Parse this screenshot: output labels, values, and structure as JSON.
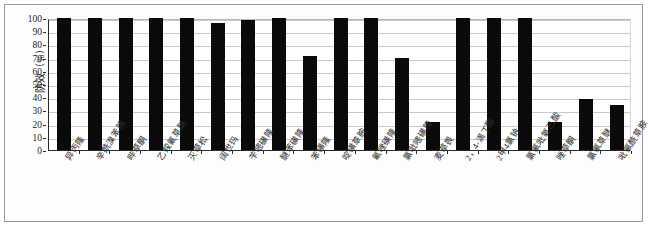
{
  "chart_data": {
    "type": "bar",
    "title": "",
    "subtitle": "",
    "xlabel": "",
    "ylabel": "防效（%）",
    "ylim": [
      0,
      100
    ],
    "yticks": [
      0,
      10,
      20,
      30,
      40,
      50,
      60,
      70,
      80,
      90,
      100
    ],
    "grid": true,
    "legend": null,
    "bar_color": "#0a0a0a",
    "categories": [
      "异丙隆",
      "辛酰溴苯腈",
      "哔草酮",
      "乙羧氟草醚",
      "灭草松",
      "阔世玛",
      "苄嘧磺隆",
      "醚苯磺隆",
      "苯磺隆",
      "啶磺草胺",
      "氟唑磺隆",
      "氯吡嘧磺隆",
      "麦草畏",
      "2，4-滴丁酯",
      "2甲4氯钠",
      "氯氟吡氧乙酸",
      "唑草酮",
      "氯氟草醚",
      "吡氟酰草胺"
    ],
    "values": [
      100,
      100,
      100,
      100,
      100,
      96.5,
      98.5,
      100,
      71,
      100,
      100,
      70,
      21,
      100,
      100,
      100,
      21,
      39,
      34
    ]
  },
  "axis": {
    "y_label_text": "防效（%）",
    "tick_labels": [
      "100",
      "90",
      "80",
      "70",
      "60",
      "50",
      "40",
      "30",
      "20",
      "10",
      "0"
    ]
  }
}
